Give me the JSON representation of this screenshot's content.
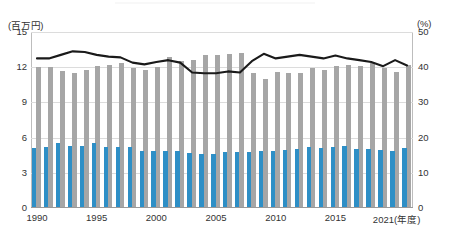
{
  "axes": {
    "left_unit": "(百万円)",
    "right_unit": "(%)",
    "x_unit_suffix": "(年度)",
    "left_ticks": [
      "15",
      "12",
      "9",
      "6",
      "3",
      "0"
    ],
    "right_ticks": [
      "50",
      "40",
      "30",
      "20",
      "10",
      "0"
    ],
    "x_ticks": [
      "1990",
      "1995",
      "2000",
      "2005",
      "2010",
      "2015",
      "2021"
    ]
  },
  "chart_data": {
    "type": "bar",
    "title": "",
    "subtitle": "",
    "xlabel": "年度",
    "ylabel": "百万円",
    "ylabel_secondary": "%",
    "ylim": [
      0,
      15
    ],
    "ylim_secondary": [
      0,
      50
    ],
    "grid": true,
    "legend_position": "none",
    "categories": [
      "1990",
      "1991",
      "1992",
      "1993",
      "1994",
      "1995",
      "1996",
      "1997",
      "1998",
      "1999",
      "2000",
      "2001",
      "2002",
      "2003",
      "2004",
      "2005",
      "2006",
      "2007",
      "2008",
      "2009",
      "2010",
      "2011",
      "2012",
      "2013",
      "2014",
      "2015",
      "2016",
      "2017",
      "2018",
      "2019",
      "2020",
      "2021"
    ],
    "series": [
      {
        "name": "総額",
        "type": "bar",
        "color": "#a6a6a6",
        "axis": "left",
        "unit": "百万円",
        "values": [
          12.0,
          12.0,
          11.7,
          11.5,
          11.8,
          12.1,
          12.2,
          12.4,
          11.9,
          11.8,
          12.0,
          12.9,
          12.5,
          12.6,
          13.0,
          13.0,
          13.1,
          13.2,
          11.5,
          11.0,
          11.6,
          11.5,
          11.5,
          11.9,
          11.8,
          12.1,
          12.2,
          12.1,
          12.4,
          11.9,
          11.6,
          12.2
        ]
      },
      {
        "name": "内数",
        "type": "bar",
        "color": "#2e8fc6",
        "axis": "left",
        "unit": "百万円",
        "values": [
          5.1,
          5.2,
          5.5,
          5.3,
          5.3,
          5.5,
          5.2,
          5.2,
          5.2,
          4.9,
          4.9,
          4.85,
          4.85,
          4.7,
          4.6,
          4.6,
          4.75,
          4.75,
          4.8,
          4.85,
          4.9,
          4.95,
          5.05,
          5.2,
          5.1,
          5.2,
          5.25,
          5.05,
          5.0,
          4.95,
          4.9,
          5.15
        ]
      },
      {
        "name": "比率",
        "type": "line",
        "color": "#1a1a1a",
        "axis": "right",
        "unit": "%",
        "values": [
          42.5,
          42.5,
          43.5,
          44.5,
          44.3,
          43.5,
          43.0,
          42.8,
          41.3,
          40.8,
          41.5,
          42.0,
          41.3,
          38.5,
          38.3,
          38.3,
          38.8,
          38.5,
          41.7,
          43.8,
          42.5,
          43.0,
          43.5,
          43.0,
          42.5,
          43.3,
          42.5,
          42.0,
          41.5,
          40.3,
          42.0,
          40.5
        ]
      }
    ]
  }
}
